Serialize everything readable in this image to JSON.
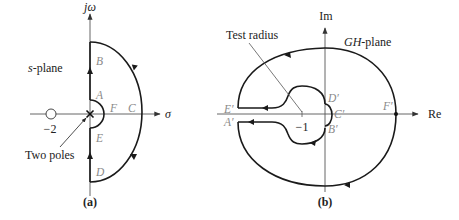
{
  "figure": {
    "panel_a": {
      "caption": "(a)",
      "plane_label_var": "s",
      "plane_label_rest": "-plane",
      "vertical_axis": "jω",
      "horizontal_axis": "σ",
      "zero_label": "−2",
      "poles_annotation": "Two poles",
      "points": {
        "A": "A",
        "B": "B",
        "C": "C",
        "D": "D",
        "E": "E",
        "F": "F"
      }
    },
    "panel_b": {
      "caption": "(b)",
      "plane_label_var": "GH",
      "plane_label_rest": "-plane",
      "vertical_axis": "Im",
      "horizontal_axis": "Re",
      "critical_point_label": "−1",
      "test_radius_label": "Test radius",
      "points": {
        "A": "A′",
        "B": "B′",
        "C": "C′",
        "D": "D′",
        "E": "E′",
        "F": "F′"
      }
    },
    "colors": {
      "curve": "#1a1a1a",
      "axis": "#555555",
      "point_labels": "#8a8a8a",
      "text": "#222222"
    }
  }
}
